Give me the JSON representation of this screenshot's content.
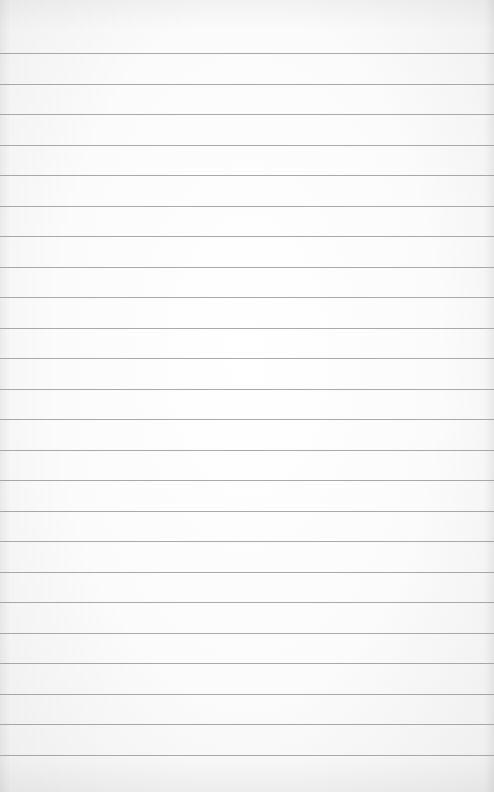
{
  "page": {
    "type": "lined-paper",
    "background_color": "#fbfbfb",
    "line_color": "#9a9a9a",
    "line_count": 24,
    "first_line_y": 53,
    "line_spacing": 30.52,
    "text": ""
  }
}
